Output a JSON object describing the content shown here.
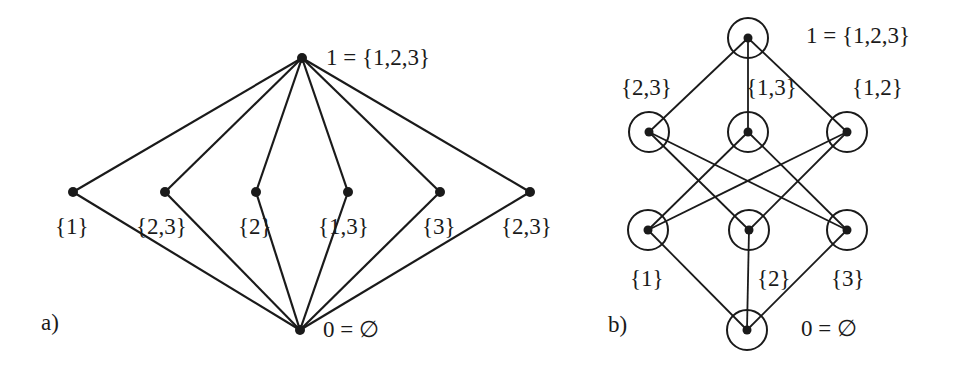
{
  "diagram_a": {
    "panel_label": "a)",
    "top": {
      "label": "1 = {1,2,3}",
      "x": 302,
      "y": 58
    },
    "bottom": {
      "label": "0 = ∅",
      "x": 300,
      "y": 330
    },
    "middle": [
      {
        "label": "{1}",
        "x": 73,
        "y": 192
      },
      {
        "label": "{2,3}",
        "x": 165,
        "y": 192
      },
      {
        "label": "{2}",
        "x": 256,
        "y": 192
      },
      {
        "label": "{1,3}",
        "x": 348,
        "y": 192
      },
      {
        "label": "{3}",
        "x": 440,
        "y": 192
      },
      {
        "label": "{2,3}",
        "x": 530,
        "y": 192
      }
    ]
  },
  "diagram_b": {
    "panel_label": "b)",
    "top": {
      "label": "1 = {1,2,3}",
      "x": 748,
      "y": 38
    },
    "bottom": {
      "label": "0 = ∅",
      "x": 747,
      "y": 330
    },
    "upper": [
      {
        "label": "{2,3}",
        "x": 649,
        "y": 132
      },
      {
        "label": "{1,3}",
        "x": 748,
        "y": 132
      },
      {
        "label": "{1,2}",
        "x": 847,
        "y": 132
      }
    ],
    "lower": [
      {
        "label": "{1}",
        "x": 648,
        "y": 230
      },
      {
        "label": "{2}",
        "x": 749,
        "y": 230
      },
      {
        "label": "{3}",
        "x": 847,
        "y": 230
      }
    ],
    "cross_edges": [
      [
        "{2,3}",
        "{2}"
      ],
      [
        "{2,3}",
        "{3}"
      ],
      [
        "{1,3}",
        "{1}"
      ],
      [
        "{1,3}",
        "{3}"
      ],
      [
        "{1,2}",
        "{1}"
      ],
      [
        "{1,2}",
        "{2}"
      ]
    ]
  }
}
